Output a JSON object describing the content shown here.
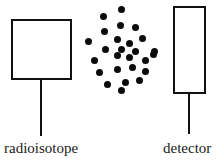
{
  "diagram": {
    "ink_color": "#111111",
    "background_color": "#ffffff",
    "source": {
      "label": "radioisotope",
      "shape": "square",
      "x": 11,
      "y": 19,
      "width": 61,
      "height": 61,
      "stem": {
        "x": 40,
        "y": 79,
        "length": 57
      }
    },
    "detector": {
      "label": "detector",
      "shape": "tall-rectangle",
      "x": 173,
      "y": 6,
      "width": 33,
      "height": 88,
      "stem": {
        "x": 188,
        "y": 93,
        "length": 41
      }
    },
    "particles": {
      "name": "radiation-particles",
      "count": 26,
      "dot_color": "#0b0b0b",
      "dot_diameter": 7,
      "points": [
        [
          121,
          9
        ],
        [
          103,
          16
        ],
        [
          120,
          25
        ],
        [
          135,
          27
        ],
        [
          104,
          31
        ],
        [
          88,
          41
        ],
        [
          117,
          39
        ],
        [
          129,
          43
        ],
        [
          142,
          38
        ],
        [
          105,
          49
        ],
        [
          121,
          49
        ],
        [
          135,
          51
        ],
        [
          154,
          51
        ],
        [
          117,
          55
        ],
        [
          129,
          57
        ],
        [
          94,
          60
        ],
        [
          145,
          60
        ],
        [
          153,
          54
        ],
        [
          99,
          72
        ],
        [
          117,
          69
        ],
        [
          132,
          67
        ],
        [
          145,
          71
        ],
        [
          107,
          84
        ],
        [
          125,
          82
        ],
        [
          139,
          80
        ],
        [
          121,
          90
        ]
      ]
    }
  }
}
